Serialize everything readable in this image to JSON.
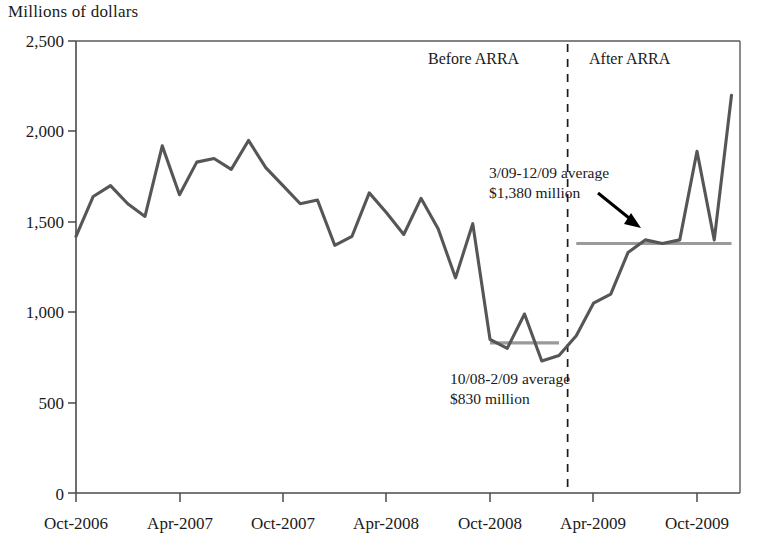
{
  "chart_data": {
    "type": "line",
    "title": "Millions of dollars",
    "xlabel": "",
    "ylabel": "Millions of dollars",
    "ylim": [
      0,
      2500
    ],
    "ytick_values": [
      0,
      500,
      1000,
      1500,
      2000,
      2500
    ],
    "ytick_labels": [
      "0",
      "500",
      "1,000",
      "1,500",
      "2,000",
      "2,500"
    ],
    "xtick_labels": [
      "Oct-2006",
      "Apr-2007",
      "Oct-2007",
      "Apr-2008",
      "Oct-2008",
      "Apr-2009",
      "Oct-2009"
    ],
    "xtick_months": [
      "2006-10",
      "2007-04",
      "2007-10",
      "2008-04",
      "2008-10",
      "2009-04",
      "2009-10"
    ],
    "grid": false,
    "legend": "none",
    "x": [
      "Oct-2006",
      "Nov-2006",
      "Dec-2006",
      "Jan-2007",
      "Feb-2007",
      "Mar-2007",
      "Apr-2007",
      "May-2007",
      "Jun-2007",
      "Jul-2007",
      "Aug-2007",
      "Sep-2007",
      "Oct-2007",
      "Nov-2007",
      "Dec-2007",
      "Jan-2008",
      "Feb-2008",
      "Mar-2008",
      "Apr-2008",
      "May-2008",
      "Jun-2008",
      "Jul-2008",
      "Aug-2008",
      "Sep-2008",
      "Oct-2008",
      "Nov-2008",
      "Dec-2008",
      "Jan-2009",
      "Feb-2009",
      "Mar-2009",
      "Apr-2009",
      "May-2009",
      "Jun-2009",
      "Jul-2009",
      "Aug-2009",
      "Sep-2009",
      "Oct-2009",
      "Nov-2009",
      "Dec-2009"
    ],
    "values": [
      1420,
      1640,
      1700,
      1600,
      1530,
      1920,
      1650,
      1830,
      1850,
      1790,
      1950,
      1800,
      1700,
      1600,
      1620,
      1370,
      1420,
      1660,
      1550,
      1430,
      1630,
      1460,
      1190,
      1490,
      850,
      800,
      990,
      730,
      760,
      870,
      1050,
      1100,
      1330,
      1400,
      1380,
      1400,
      1890,
      1400,
      2200
    ],
    "series_color": "#565656",
    "average_lines": [
      {
        "name": "10/08-2/09 average",
        "value": 830,
        "start": "Oct-2008",
        "end": "Feb-2009",
        "color": "#9a9a9a"
      },
      {
        "name": "3/09-12/09 average",
        "value": 1380,
        "start": "Mar-2009",
        "end": "Dec-2009",
        "color": "#9a9a9a"
      }
    ],
    "annotations": [
      {
        "id": "after-arra-note",
        "line1": "3/09-12/09 average",
        "line2": "$1,380 million",
        "has_arrow": true
      },
      {
        "id": "before-arra-note",
        "line1": "10/08-2/09 average",
        "line2": "$830 million",
        "has_arrow": false
      }
    ],
    "divider": {
      "label_left": "Before ARRA",
      "label_right": "After ARRA",
      "at": "Mar-2009",
      "style": "dashed"
    }
  }
}
